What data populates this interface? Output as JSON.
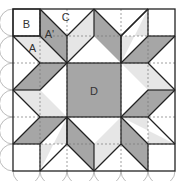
{
  "diagram": {
    "title": "",
    "origin": [
      13,
      9
    ],
    "cell": 27,
    "grid": 6,
    "colors": {
      "dark": "#a6a6a6",
      "light": "#e6e6e6",
      "white": "#ffffff",
      "stroke": "#222222",
      "dash": "#777777",
      "arc": "#aaaaaa"
    },
    "labels": [
      {
        "text": "B",
        "x": 0.5,
        "y": 0.55
      },
      {
        "text": "C",
        "x": 1.95,
        "y": 0.28
      },
      {
        "text": "A'",
        "x": 1.35,
        "y": 0.92
      },
      {
        "text": "A",
        "x": 0.72,
        "y": 1.45
      },
      {
        "text": "D",
        "x": 3.0,
        "y": 3.05
      }
    ],
    "shapes": [
      {
        "fill": "dark",
        "pts": [
          [
            2,
            2
          ],
          [
            4,
            2
          ],
          [
            4,
            4
          ],
          [
            2,
            4
          ]
        ]
      },
      {
        "fill": "dark",
        "pts": [
          [
            1,
            0
          ],
          [
            2,
            1
          ],
          [
            2,
            2
          ],
          [
            1,
            1
          ]
        ]
      },
      {
        "fill": "light",
        "pts": [
          [
            0,
            1
          ],
          [
            1,
            1
          ],
          [
            2,
            2
          ],
          [
            1,
            2
          ]
        ]
      },
      {
        "fill": "light",
        "pts": [
          [
            3,
            0
          ],
          [
            3,
            1
          ],
          [
            2,
            2
          ],
          [
            2,
            1
          ]
        ]
      },
      {
        "fill": "dark",
        "pts": [
          [
            3,
            0
          ],
          [
            4,
            1
          ],
          [
            4,
            2
          ],
          [
            3,
            1
          ]
        ]
      },
      {
        "fill": "light",
        "pts": [
          [
            5,
            1
          ],
          [
            4,
            1
          ],
          [
            4,
            2
          ],
          [
            5,
            0
          ]
        ]
      },
      {
        "fill": "dark",
        "pts": [
          [
            6,
            1
          ],
          [
            5,
            1
          ],
          [
            4,
            2
          ],
          [
            5,
            2
          ]
        ]
      },
      {
        "fill": "light",
        "pts": [
          [
            6,
            3
          ],
          [
            5,
            3
          ],
          [
            4,
            2
          ],
          [
            5,
            2
          ]
        ]
      },
      {
        "fill": "dark",
        "pts": [
          [
            6,
            3
          ],
          [
            5,
            4
          ],
          [
            4,
            4
          ],
          [
            5,
            3
          ]
        ]
      },
      {
        "fill": "light",
        "pts": [
          [
            5,
            5
          ],
          [
            5,
            4
          ],
          [
            4,
            4
          ],
          [
            6,
            5
          ]
        ]
      },
      {
        "fill": "dark",
        "pts": [
          [
            5,
            6
          ],
          [
            4,
            5
          ],
          [
            4,
            4
          ],
          [
            5,
            5
          ]
        ]
      },
      {
        "fill": "light",
        "pts": [
          [
            3,
            6
          ],
          [
            3,
            5
          ],
          [
            4,
            4
          ],
          [
            4,
            5
          ]
        ]
      },
      {
        "fill": "dark",
        "pts": [
          [
            3,
            6
          ],
          [
            2,
            5
          ],
          [
            2,
            4
          ],
          [
            3,
            5
          ]
        ]
      },
      {
        "fill": "light",
        "pts": [
          [
            1,
            5
          ],
          [
            2,
            5
          ],
          [
            2,
            4
          ],
          [
            1,
            6
          ]
        ]
      },
      {
        "fill": "dark",
        "pts": [
          [
            0,
            5
          ],
          [
            1,
            5
          ],
          [
            2,
            4
          ],
          [
            1,
            4
          ]
        ]
      },
      {
        "fill": "light",
        "pts": [
          [
            0,
            3
          ],
          [
            1,
            3
          ],
          [
            2,
            4
          ],
          [
            1,
            4
          ]
        ]
      },
      {
        "fill": "dark",
        "pts": [
          [
            0,
            3
          ],
          [
            1,
            2
          ],
          [
            2,
            2
          ],
          [
            1,
            3
          ]
        ]
      },
      {
        "fill": "light",
        "pts": [
          [
            1,
            1
          ],
          [
            1,
            2
          ],
          [
            2,
            2
          ],
          [
            0,
            1
          ]
        ]
      }
    ],
    "lines": [
      [
        [
          0,
          1
        ],
        [
          1,
          2
        ]
      ],
      [
        [
          1,
          2
        ],
        [
          2,
          2
        ]
      ],
      [
        [
          1,
          0
        ],
        [
          2,
          1
        ]
      ],
      [
        [
          2,
          1
        ],
        [
          3,
          0
        ]
      ],
      [
        [
          3,
          0
        ],
        [
          4,
          1
        ]
      ],
      [
        [
          4,
          1
        ],
        [
          5,
          0
        ]
      ],
      [
        [
          2,
          1
        ],
        [
          2,
          2
        ]
      ],
      [
        [
          4,
          1
        ],
        [
          4,
          2
        ]
      ],
      [
        [
          1,
          2
        ],
        [
          0,
          3
        ]
      ],
      [
        [
          5,
          0
        ],
        [
          4,
          1
        ]
      ],
      [
        [
          6,
          1
        ],
        [
          5,
          2
        ]
      ],
      [
        [
          5,
          2
        ],
        [
          6,
          3
        ]
      ],
      [
        [
          6,
          3
        ],
        [
          5,
          4
        ]
      ],
      [
        [
          5,
          4
        ],
        [
          6,
          5
        ]
      ],
      [
        [
          5,
          6
        ],
        [
          4,
          5
        ]
      ],
      [
        [
          4,
          5
        ],
        [
          3,
          6
        ]
      ],
      [
        [
          3,
          6
        ],
        [
          2,
          5
        ]
      ],
      [
        [
          2,
          5
        ],
        [
          1,
          6
        ]
      ],
      [
        [
          0,
          5
        ],
        [
          1,
          4
        ]
      ],
      [
        [
          1,
          4
        ],
        [
          0,
          3
        ]
      ],
      [
        [
          2,
          2
        ],
        [
          3,
          1
        ]
      ],
      [
        [
          3,
          1
        ],
        [
          3,
          0
        ]
      ],
      [
        [
          2,
          2
        ],
        [
          1,
          1
        ]
      ],
      [
        [
          1,
          1
        ],
        [
          1,
          0
        ]
      ],
      [
        [
          1,
          1
        ],
        [
          0,
          1
        ]
      ],
      [
        [
          4,
          2
        ],
        [
          5,
          1
        ]
      ],
      [
        [
          5,
          1
        ],
        [
          6,
          1
        ]
      ],
      [
        [
          4,
          2
        ],
        [
          5,
          2
        ]
      ],
      [
        [
          4,
          4
        ],
        [
          5,
          3
        ]
      ],
      [
        [
          5,
          3
        ],
        [
          6,
          3
        ]
      ],
      [
        [
          4,
          4
        ],
        [
          5,
          5
        ]
      ],
      [
        [
          5,
          5
        ],
        [
          5,
          6
        ]
      ],
      [
        [
          5,
          5
        ],
        [
          6,
          5
        ]
      ],
      [
        [
          4,
          4
        ],
        [
          4,
          5
        ]
      ],
      [
        [
          2,
          4
        ],
        [
          3,
          5
        ]
      ],
      [
        [
          3,
          5
        ],
        [
          3,
          6
        ]
      ],
      [
        [
          2,
          4
        ],
        [
          1,
          5
        ]
      ],
      [
        [
          1,
          5
        ],
        [
          1,
          6
        ]
      ],
      [
        [
          1,
          5
        ],
        [
          0,
          5
        ]
      ],
      [
        [
          2,
          4
        ],
        [
          2,
          5
        ]
      ],
      [
        [
          2,
          4
        ],
        [
          1,
          4
        ]
      ],
      [
        [
          2,
          2
        ],
        [
          1,
          3
        ]
      ],
      [
        [
          1,
          3
        ],
        [
          0,
          3
        ]
      ],
      [
        [
          4,
          2
        ],
        [
          4,
          1
        ]
      ],
      [
        [
          5,
          1
        ],
        [
          5,
          0
        ]
      ],
      [
        [
          4,
          4
        ],
        [
          5,
          4
        ]
      ],
      [
        [
          2,
          4
        ],
        [
          2,
          5
        ]
      ]
    ],
    "dashed": [
      [
        [
          0,
          2
        ],
        [
          6,
          2
        ]
      ],
      [
        [
          0,
          4
        ],
        [
          6,
          4
        ]
      ],
      [
        [
          2,
          0
        ],
        [
          2,
          6
        ]
      ],
      [
        [
          4,
          0
        ],
        [
          4,
          6
        ]
      ],
      [
        [
          0,
          1
        ],
        [
          6,
          1
        ]
      ],
      [
        [
          0,
          5
        ],
        [
          6,
          5
        ]
      ],
      [
        [
          1,
          0
        ],
        [
          1,
          6
        ]
      ],
      [
        [
          5,
          0
        ],
        [
          5,
          6
        ]
      ]
    ]
  }
}
